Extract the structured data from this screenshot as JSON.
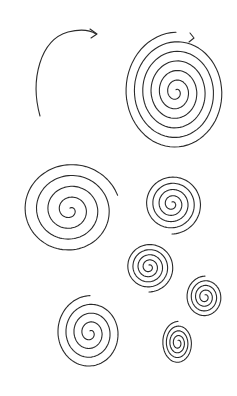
{
  "illustration": {
    "description": "Hand-drawn black ink spirals on white paper",
    "background": "#ffffff",
    "ink": "#2a2a2a",
    "arc": {
      "cx": 68,
      "cy": 90,
      "rx": 32,
      "ry": 60
    },
    "spirals": [
      {
        "name": "large-spiral-arrow",
        "cx": 176,
        "cy": 92,
        "rmax": 52,
        "turns": 6,
        "sy": 1.15
      },
      {
        "name": "spiral-mid-left",
        "cx": 70,
        "cy": 210,
        "rmax": 50,
        "turns": 4.2,
        "sy": 0.95
      },
      {
        "name": "spiral-mid-right",
        "cx": 172,
        "cy": 204,
        "rmax": 30,
        "turns": 4.5,
        "sy": 1.0
      },
      {
        "name": "spiral-center-small",
        "cx": 149,
        "cy": 267,
        "rmax": 25,
        "turns": 4.5,
        "sy": 1.0
      },
      {
        "name": "spiral-right-small",
        "cx": 205,
        "cy": 297,
        "rmax": 19,
        "turns": 4,
        "sy": 1.1
      },
      {
        "name": "spiral-bottom-left",
        "cx": 90,
        "cy": 333,
        "rmax": 34,
        "turns": 4,
        "sy": 1.1
      },
      {
        "name": "spiral-bottom-right",
        "cx": 178,
        "cy": 343,
        "rmax": 16,
        "turns": 4,
        "sy": 1.35
      }
    ]
  }
}
